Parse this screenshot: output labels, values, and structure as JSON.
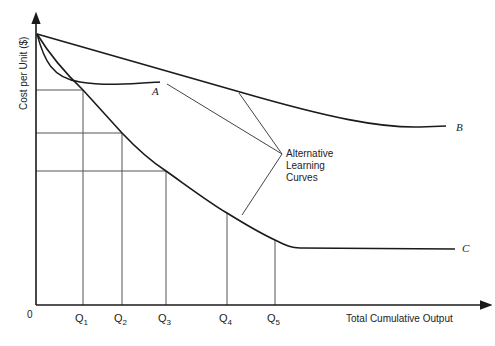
{
  "diagram": {
    "type": "learning-curves",
    "y_axis_label": "Cost per Unit ($)",
    "x_axis_label": "Total Cumulative Output",
    "origin_label": "0",
    "q_ticks": [
      {
        "base": "Q",
        "sub": "1"
      },
      {
        "base": "Q",
        "sub": "2"
      },
      {
        "base": "Q",
        "sub": "3"
      },
      {
        "base": "Q",
        "sub": "4"
      },
      {
        "base": "Q",
        "sub": "5"
      }
    ],
    "curves": [
      {
        "label": "A",
        "description": "steep initial drop then flattens early"
      },
      {
        "label": "B",
        "description": "gradual decline then flattens"
      },
      {
        "label": "C",
        "description": "steady steep decline then flattens at Q5"
      }
    ],
    "annotation": {
      "lines": [
        "Alternative",
        "Learning",
        "Curves"
      ]
    }
  },
  "colors": {
    "curve": "#1a1a1a",
    "guide": "#555555",
    "text": "#222222"
  }
}
